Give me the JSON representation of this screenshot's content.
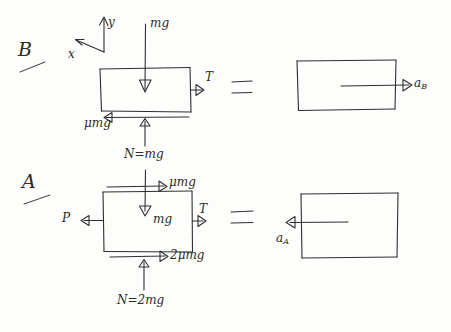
{
  "figure": {
    "kind": "hand-drawn free-body diagram",
    "ink_color": "#2f2f2f",
    "paper_color": "#fdfdfc",
    "rows": [
      {
        "id": "row-b",
        "case_label": "B",
        "axes": {
          "y_label": "y",
          "x_label": "x",
          "y_direction": "up",
          "x_direction": "left"
        },
        "fbd": {
          "weight": "mg",
          "tension": "T",
          "friction": "μmg",
          "normal": "N=mg"
        },
        "equals": "=",
        "result": {
          "accel_label": "a",
          "accel_subscript": "B",
          "direction": "right"
        }
      },
      {
        "id": "row-a",
        "case_label": "A",
        "fbd": {
          "applied": "P",
          "weight": "mg",
          "tension": "T",
          "friction_top": "μmg",
          "friction_bottom": "2μmg",
          "normal": "N=2mg"
        },
        "equals": "=",
        "result": {
          "accel_label": "a",
          "accel_subscript": "A",
          "direction": "left"
        }
      }
    ]
  }
}
